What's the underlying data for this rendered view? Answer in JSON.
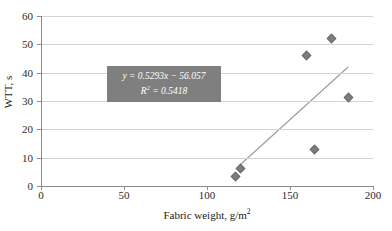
{
  "chart_data": {
    "type": "scatter",
    "title": "",
    "xlabel": "Fabric weight, g/m2",
    "ylabel": "WTT, s",
    "xlim": [
      0,
      200
    ],
    "ylim": [
      0,
      60
    ],
    "grid": "horizontal",
    "legend": "none",
    "x_ticks": [
      "0",
      "50",
      "100",
      "150",
      "200"
    ],
    "x_tick_values": [
      0,
      50,
      100,
      150,
      200
    ],
    "y_ticks": [
      "0",
      "10",
      "20",
      "30",
      "40",
      "50",
      "60"
    ],
    "y_tick_values": [
      0,
      10,
      20,
      30,
      40,
      50,
      60
    ],
    "series": [
      {
        "name": "WTT vs fabric weight",
        "marker": "diamond",
        "color": "#7d7d7d",
        "points": [
          {
            "x": 117,
            "y": 3.2
          },
          {
            "x": 120,
            "y": 6.3
          },
          {
            "x": 160,
            "y": 46.2
          },
          {
            "x": 165,
            "y": 12.8
          },
          {
            "x": 175,
            "y": 52.0
          },
          {
            "x": 185,
            "y": 31.3
          }
        ]
      }
    ],
    "trendline": {
      "type": "linear",
      "color": "#9b9b9b",
      "slope": 0.5293,
      "intercept": -56.057,
      "r_squared": 0.5418,
      "x_start": 120,
      "x_end": 185,
      "y_start": 7.5,
      "y_end": 42.0
    },
    "annotations": {
      "equation_box": {
        "equation": "y = 0.5293x − 56.057",
        "r_squared_prefix": "R",
        "r_squared_exponent": "2",
        "r_squared_value": " = 0.5418",
        "background_color": "#7f7f7f",
        "text_color": "#ffffff"
      }
    }
  },
  "axis": {
    "x_title_main": "Fabric weight, g/m",
    "x_title_exponent": "2",
    "y_title": "WTT, s"
  }
}
